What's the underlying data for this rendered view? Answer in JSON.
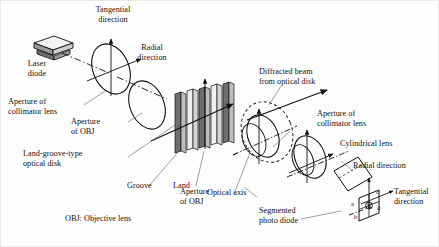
{
  "figure": {
    "caption_legend": "OBJ: Objective lens",
    "line_color": "#111111",
    "groove_fill": "#6e6e6e",
    "land_fill": "#e6e6e6",
    "background": "#fdfdfd"
  },
  "labels": {
    "tangential_direction_left": "Tangential\ndirection",
    "radial_direction_left": "Radial\ndirection",
    "laser_diode": "Laser\ndiode",
    "aperture_collimator_left": "Aperture of\ncollimator lens",
    "aperture_obj_left": "Aperture\nof OBJ",
    "land_groove_disk": "Land-groove-type\noptical disk",
    "groove": "Groove",
    "land": "Land",
    "aperture_obj_mid": "Aperture\nof OBJ",
    "diffracted_beam": "Diffracted beam\nfrom optical disk",
    "aperture_collimator_right": "Aperture of\ncollimator lens",
    "cylindrical_lens": "Cylindrical lens",
    "optical_axis": "Optical axis",
    "segmented_photo_diode": "Segmented\nphoto diode",
    "radial_direction_right": "Radial direction",
    "tangential_direction_right": "Tangential\ndirection",
    "legend": "OBJ: Objective lens"
  },
  "photo_diode_segments": {
    "a": "a",
    "b": "b",
    "c": "c",
    "d": "d"
  },
  "components": [
    {
      "name": "laser-diode",
      "type": "box"
    },
    {
      "name": "collimator-lens-aperture-left",
      "type": "ellipse"
    },
    {
      "name": "objective-lens-aperture-left",
      "type": "ellipse"
    },
    {
      "name": "land-groove-optical-disk",
      "type": "grating"
    },
    {
      "name": "objective-lens-aperture-mid",
      "type": "ellipse"
    },
    {
      "name": "collimator-lens-aperture-right",
      "type": "ellipse"
    },
    {
      "name": "cylindrical-lens",
      "type": "parallelogram"
    },
    {
      "name": "segmented-photo-diode",
      "type": "quad-detector"
    }
  ]
}
